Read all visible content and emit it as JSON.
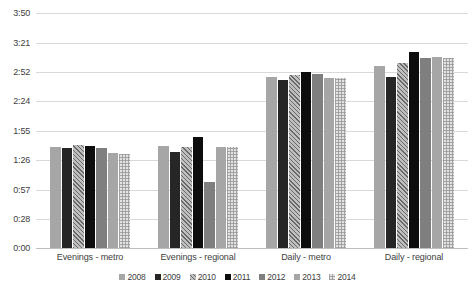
{
  "chart_data": {
    "type": "bar",
    "title": "",
    "subtitle": "",
    "xlabel": "",
    "ylabel": "",
    "grid": true,
    "legend_position": "bottom",
    "axis_value_format": "h:mm",
    "ylim": [
      "0:00",
      "3:50"
    ],
    "ylim_minutes": [
      0,
      230
    ],
    "yticks": [
      "0:00",
      "0:28",
      "0:57",
      "1:26",
      "1:55",
      "2:24",
      "2:52",
      "3:21",
      "3:50"
    ],
    "yticks_minutes": [
      0,
      28,
      57,
      86,
      115,
      144,
      172,
      201,
      230
    ],
    "categories": [
      "Evenings - metro",
      "Evenings - regional",
      "Daily - metro",
      "Daily - regional"
    ],
    "series": [
      {
        "name": "2008",
        "color": "#a6a6a6",
        "values": [
          "1:39",
          "1:40",
          "2:47",
          "2:58"
        ],
        "values_minutes": [
          99,
          100,
          167,
          178
        ]
      },
      {
        "name": "2009",
        "color": "#262626",
        "values": [
          "1:38",
          "1:34",
          "2:44",
          "2:47"
        ],
        "values_minutes": [
          98,
          94,
          164,
          167
        ]
      },
      {
        "name": "2010",
        "color": "#bfbfbf",
        "values": [
          "1:41",
          "1:39",
          "2:49",
          "3:01"
        ],
        "values_minutes": [
          101,
          99,
          169,
          181
        ]
      },
      {
        "name": "2011",
        "color": "#0d0d0d",
        "values": [
          "1:40",
          "1:49",
          "2:52",
          "3:12"
        ],
        "values_minutes": [
          100,
          109,
          172,
          192
        ]
      },
      {
        "name": "2012",
        "color": "#7f7f7f",
        "values": [
          "1:38",
          "1:05",
          "2:50",
          "3:06"
        ],
        "values_minutes": [
          98,
          65,
          170,
          186
        ]
      },
      {
        "name": "2013",
        "color": "#a6a6a6",
        "values": [
          "1:33",
          "1:39",
          "2:46",
          "3:07"
        ],
        "values_minutes": [
          93,
          99,
          166,
          187
        ]
      },
      {
        "name": "2014",
        "color": "#e2e2e2",
        "values": [
          "1:32",
          "1:39",
          "2:46",
          "3:06"
        ],
        "values_minutes": [
          92,
          99,
          166,
          186
        ]
      }
    ]
  }
}
